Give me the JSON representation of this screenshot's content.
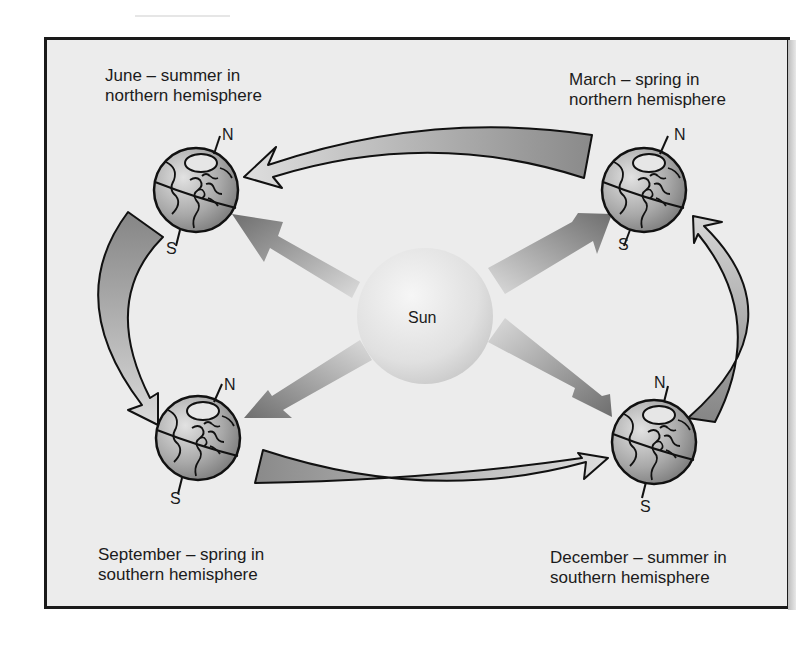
{
  "diagram": {
    "center": {
      "label": "Sun"
    },
    "positions": [
      {
        "id": "june",
        "month": "June",
        "line1": "June  –  summer in",
        "line2": "northern hemisphere",
        "north": "N",
        "south": "S"
      },
      {
        "id": "march",
        "month": "March",
        "line1": "March  –  spring in",
        "line2": "northern hemisphere",
        "north": "N",
        "south": "S"
      },
      {
        "id": "september",
        "month": "September",
        "line1": "September  –  spring in",
        "line2": "southern hemisphere",
        "north": "N",
        "south": "S"
      },
      {
        "id": "december",
        "month": "December",
        "line1": "December  –  summer in",
        "line2": "southern hemisphere",
        "north": "N",
        "south": "S"
      }
    ],
    "orbit_arrows": [
      {
        "from": "March",
        "to": "June"
      },
      {
        "from": "June",
        "to": "September"
      },
      {
        "from": "September",
        "to": "December"
      },
      {
        "from": "December",
        "to": "March"
      }
    ],
    "sunlight_arrows": [
      "Sun to June",
      "Sun to March",
      "Sun to September",
      "Sun to December"
    ]
  },
  "colors": {
    "background": "#ececec",
    "frame": "#1a1a1a",
    "arrow_dark": "#7a7a7a",
    "arrow_light": "#d4d4d4",
    "sun": "#e4e4e4",
    "globe_dark": "#8c8c8c",
    "globe_light": "#d8d8d8"
  }
}
